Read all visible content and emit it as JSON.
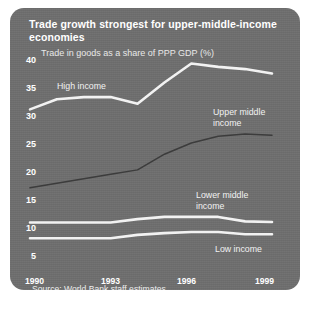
{
  "panel": {
    "background_color": "#6e6e6e",
    "text_color": "#ffffff"
  },
  "title": "Trade growth strongest for upper-middle-income economies",
  "subtitle": "Trade in goods as a share of PPP GDP (%)",
  "source": "Source: World Bank staff estimates.",
  "axis": {
    "y_ticks": [
      "40",
      "35",
      "30",
      "25",
      "20",
      "15",
      "10",
      "5"
    ],
    "x_ticks": [
      "1990",
      "1993",
      "1996",
      "1999"
    ]
  },
  "series_labels": [
    {
      "name": "high-income",
      "line1": "High income",
      "line2": ""
    },
    {
      "name": "upper-middle-income",
      "line1": "Upper middle",
      "line2": "income"
    },
    {
      "name": "lower-middle-income",
      "line1": "Lower middle",
      "line2": "income"
    },
    {
      "name": "low-income",
      "line1": "Low income",
      "line2": ""
    }
  ],
  "chart_data": {
    "type": "line",
    "title": "Trade growth strongest for upper-middle-income economies",
    "subtitle": "Trade in goods as a share of PPP GDP (%)",
    "xlabel": "",
    "ylabel": "Trade in goods as a share of PPP GDP (%)",
    "x": [
      1990,
      1991,
      1992,
      1993,
      1994,
      1995,
      1996,
      1997,
      1998,
      1999
    ],
    "xlim": [
      1990,
      1999
    ],
    "ylim": [
      5,
      40
    ],
    "y_ticks": [
      5,
      10,
      15,
      20,
      25,
      30,
      35,
      40
    ],
    "x_ticks": [
      1990,
      1993,
      1996,
      1999
    ],
    "grid": false,
    "legend": "inline-annotations",
    "series": [
      {
        "name": "High income",
        "color": "#f2f2f2",
        "values": [
          31.0,
          32.8,
          33.2,
          33.2,
          32.0,
          35.8,
          39.2,
          38.6,
          38.2,
          37.4
        ]
      },
      {
        "name": "Upper middle income",
        "color": "#3c3c3c",
        "values": [
          17.0,
          17.8,
          18.6,
          19.4,
          20.2,
          23.0,
          25.0,
          26.2,
          26.6,
          26.4
        ]
      },
      {
        "name": "Lower middle income",
        "color": "#f2f2f2",
        "values": [
          10.8,
          10.8,
          10.8,
          10.8,
          11.4,
          11.8,
          11.8,
          11.8,
          11.0,
          10.9
        ]
      },
      {
        "name": "Low income",
        "color": "#f2f2f2",
        "values": [
          8.0,
          8.0,
          8.0,
          8.0,
          8.6,
          8.9,
          9.1,
          9.1,
          8.7,
          8.7
        ]
      }
    ]
  }
}
